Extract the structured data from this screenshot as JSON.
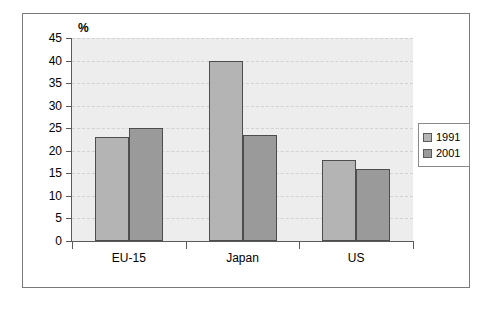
{
  "chart_data": {
    "type": "bar",
    "title": "",
    "subtitle": "",
    "xlabel": "",
    "ylabel": "%",
    "categories": [
      "EU-15",
      "Japan",
      "US"
    ],
    "series": [
      {
        "name": "1991",
        "values": [
          23,
          40,
          18
        ],
        "color": "#b4b4b4"
      },
      {
        "name": "2001",
        "values": [
          25,
          23.5,
          16
        ],
        "color": "#9a9a9a"
      }
    ],
    "ylim": [
      0,
      45
    ],
    "ytick_labels": [
      "45",
      "40",
      "35",
      "30",
      "25",
      "20",
      "15",
      "10",
      "5",
      "0"
    ],
    "ytick_values": [
      45,
      40,
      35,
      30,
      25,
      20,
      15,
      10,
      5,
      0
    ],
    "grid": "horizontal-dashed",
    "legend_position": "right",
    "legend_entries": [
      "1991",
      "2001"
    ],
    "plot_background": "#ededed",
    "figure_background": "#ffffff",
    "axis_color": "#5a5a5a"
  }
}
